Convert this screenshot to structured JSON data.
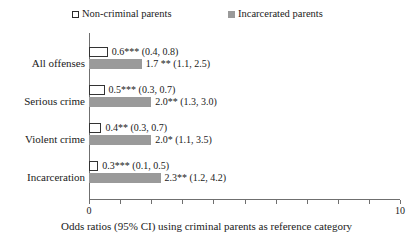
{
  "chart_data": {
    "type": "bar",
    "orientation": "horizontal",
    "title": "",
    "xlabel": "Odds ratios (95% CI) using criminal parents as reference category",
    "ylabel": "",
    "xlim": [
      0,
      10
    ],
    "xticks": [
      0,
      1,
      2,
      3,
      4,
      5,
      6,
      7,
      8,
      9,
      10
    ],
    "xtick_labels": [
      "0",
      "",
      "",
      "",
      "",
      "",
      "",
      "",
      "",
      "",
      "10"
    ],
    "grid": false,
    "legend_position": "top",
    "categories": [
      "All offenses",
      "Serious crime",
      "Violent crime",
      "Incarceration"
    ],
    "series": [
      {
        "name": "Non-criminal parents",
        "color": "#ffffff",
        "edge_color": "#333333",
        "values": [
          0.6,
          0.5,
          0.4,
          0.3
        ],
        "ci_low": [
          0.4,
          0.3,
          0.3,
          0.1
        ],
        "ci_high": [
          0.8,
          0.7,
          0.7,
          0.5
        ],
        "data_labels": [
          "0.6*** (0.4, 0.8)",
          "0.5*** (0.3, 0.7)",
          "0.4** (0.3, 0.7)",
          "0.3*** (0.1, 0.5)"
        ]
      },
      {
        "name": "Incarcerated parents",
        "color": "#9a9a9a",
        "edge_color": "#9a9a9a",
        "values": [
          1.7,
          2.0,
          2.0,
          2.3
        ],
        "ci_low": [
          1.1,
          1.3,
          1.1,
          1.2
        ],
        "ci_high": [
          2.5,
          3.0,
          3.5,
          4.2
        ],
        "data_labels": [
          "1.7 ** (1.1, 2.5)",
          "2.0** (1.3, 3.0)",
          "2.0* (1.1, 3.5)",
          "2.3** (1.2, 4.2)"
        ]
      }
    ]
  },
  "legend": {
    "entries": [
      {
        "label": "Non-criminal parents",
        "marker": "open-square"
      },
      {
        "label": "Incarcerated parents",
        "marker": "filled-square"
      }
    ]
  },
  "axis": {
    "x_min_label": "0",
    "x_max_label": "10"
  },
  "caption": {
    "text": "Odds ratios (95% CI) using criminal parents as reference category"
  }
}
